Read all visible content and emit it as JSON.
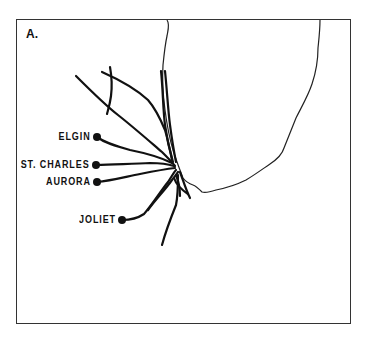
{
  "figure": {
    "panel_label": "A.",
    "cities": [
      {
        "name": "ELGIN",
        "x": 97,
        "y": 137
      },
      {
        "name": "ST. CHARLES",
        "x": 96,
        "y": 165
      },
      {
        "name": "AURORA",
        "x": 97,
        "y": 182
      },
      {
        "name": "JOLIET",
        "x": 122,
        "y": 220
      }
    ],
    "colors": {
      "ink": "#111111",
      "background": "#ffffff",
      "frame": "#333333"
    }
  }
}
